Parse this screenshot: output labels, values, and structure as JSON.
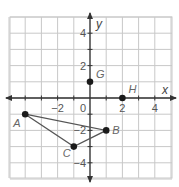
{
  "diagram": {
    "type": "coordinate-plane",
    "x_axis_label": "x",
    "y_axis_label": "y",
    "origin_label": "0",
    "x_range": [
      -4.9,
      5.1
    ],
    "y_range": [
      -4.9,
      5.0
    ],
    "x_tick_labels": [
      {
        "value": -2,
        "label": "−2"
      },
      {
        "value": 2,
        "label": "2"
      },
      {
        "value": 4,
        "label": "4"
      }
    ],
    "y_tick_labels": [
      {
        "value": 4,
        "label": "4"
      },
      {
        "value": 2,
        "label": "2"
      },
      {
        "value": -2,
        "label": "−2"
      },
      {
        "value": -4,
        "label": "−4"
      }
    ],
    "points": [
      {
        "name": "A",
        "x": -4,
        "y": -1
      },
      {
        "name": "B",
        "x": 1,
        "y": -2
      },
      {
        "name": "C",
        "x": -1,
        "y": -3
      },
      {
        "name": "G",
        "x": 0,
        "y": 1
      },
      {
        "name": "H",
        "x": 2,
        "y": 0
      }
    ],
    "polygons": [
      {
        "name": "triangle-ABC",
        "vertices": [
          "A",
          "B",
          "C"
        ]
      }
    ],
    "colors": {
      "grid": "#c8c8c8",
      "axis": "#333333",
      "point": "#1a1a1a",
      "segment": "#555555",
      "label": "#666666"
    }
  }
}
